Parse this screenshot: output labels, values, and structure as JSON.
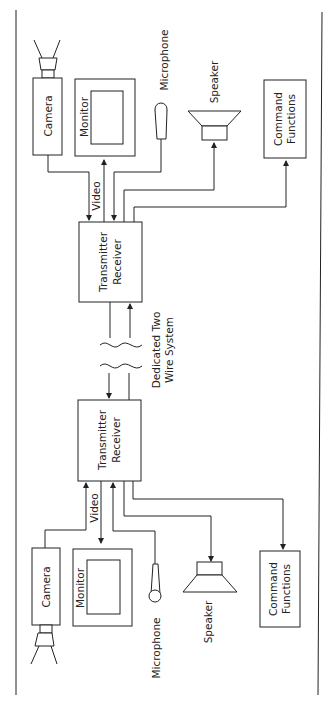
{
  "diagram": {
    "type": "block diagram (rotated 90°)",
    "labels": {
      "camera": "Camera",
      "monitor": "Monitor",
      "microphone": "Microphone",
      "speaker": "Speaker",
      "command_line1": "Command",
      "command_line2": "Functions",
      "video": "Video",
      "tx_line1": "Transmitter",
      "tx_line2": "Receiver",
      "wire_line1": "Dedicated Two",
      "wire_line2": "Wire System"
    },
    "stations": [
      {
        "name": "station-top",
        "components": [
          "Camera",
          "Monitor",
          "Microphone",
          "Speaker",
          "Command Functions",
          "Transmitter Receiver"
        ]
      },
      {
        "name": "station-bottom",
        "components": [
          "Camera",
          "Monitor",
          "Microphone",
          "Speaker",
          "Command Functions",
          "Transmitter Receiver"
        ]
      }
    ],
    "link": "Dedicated Two Wire System"
  }
}
